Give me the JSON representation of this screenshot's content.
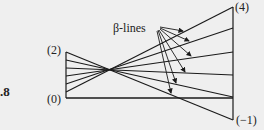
{
  "figure_number_fragment": ".8",
  "labels": {
    "top_left": "(2)",
    "bottom_left": "(0)",
    "top_right": "(4)",
    "bottom_right": "(−1)",
    "beta_lines": "β-lines"
  },
  "geometry": {
    "left_axis": {
      "x": 66,
      "y_top": 52,
      "y_bottom": 98
    },
    "right_axis": {
      "x": 233,
      "y_top": 7,
      "y_bottom": 120
    },
    "focal_point": {
      "x": 112,
      "y": 72
    },
    "baseline_y": 98,
    "fan_left_y": [
      52,
      60,
      68,
      76,
      84,
      92
    ],
    "fan_right_y": [
      7,
      28,
      52,
      75,
      97,
      120
    ]
  },
  "colors": {
    "background": "#efefef",
    "stroke": "#1a1a1a"
  }
}
